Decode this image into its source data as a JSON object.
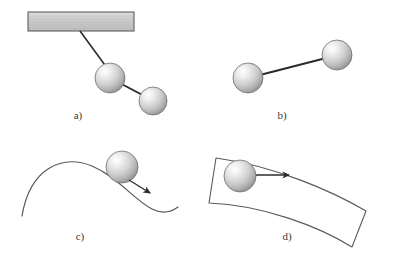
{
  "figure": {
    "background_color": "#ffffff",
    "stroke_color": "#2b2b2b",
    "curve_color": "#5a5a5a",
    "sphere_fill_light": "#fdfdfd",
    "sphere_fill_mid": "#d2d2d2",
    "sphere_fill_dark": "#9a9a9a",
    "sphere_edge": "#6e6e6e",
    "bar_fill": "#c9c9c9",
    "bar_edge": "#5e5e5e"
  },
  "panels": [
    {
      "id": "a",
      "label": "a)",
      "label_x": 78,
      "label_y": 119,
      "description": "double pendulum suspended from a fixed support bar",
      "support_bar": {
        "x": 28,
        "y": 12,
        "width": 106,
        "height": 19
      },
      "rods": [
        {
          "x1": 80,
          "y1": 31,
          "x2": 110,
          "y2": 72
        },
        {
          "x1": 114,
          "y1": 80,
          "x2": 148,
          "y2": 97
        }
      ],
      "spheres": [
        {
          "cx": 110,
          "cy": 78,
          "r": 15
        },
        {
          "cx": 153,
          "cy": 101,
          "r": 14
        }
      ]
    },
    {
      "id": "b",
      "label": "b)",
      "label_x": 282,
      "label_y": 119,
      "description": "free rigid body of two spheres joined by a rod",
      "rods": [
        {
          "x1": 256,
          "y1": 76,
          "x2": 328,
          "y2": 57
        }
      ],
      "spheres": [
        {
          "cx": 248,
          "cy": 78,
          "r": 15
        },
        {
          "cx": 337,
          "cy": 55,
          "r": 15
        }
      ]
    },
    {
      "id": "c",
      "label": "c)",
      "label_x": 80,
      "label_y": 240,
      "description": "ball rolling along an S-shaped curved track with velocity arrow",
      "curve_path": "M 22 216 C 30 168, 62 154, 92 166 C 118 177, 134 200, 152 209 C 162 214, 170 213, 178 207",
      "spheres": [
        {
          "cx": 122,
          "cy": 167,
          "r": 16
        }
      ],
      "arrow": {
        "x1": 129,
        "y1": 179,
        "x2": 150,
        "y2": 192
      }
    },
    {
      "id": "d",
      "label": "d)",
      "label_x": 287,
      "label_y": 240,
      "description": "ball on a curved band surface with horizontal velocity arrow",
      "band_path": "M 216 158 L 209 203 C 262 205, 318 226, 352 247 L 366 211 C 330 190, 274 166, 216 158 Z",
      "band_top_path": "M 216 158 C 274 166, 330 190, 366 211",
      "band_bottom_path": "M 209 203 C 262 205, 318 226, 352 247",
      "spheres": [
        {
          "cx": 240,
          "cy": 176,
          "r": 16
        }
      ],
      "arrow": {
        "x1": 255,
        "y1": 175,
        "x2": 288,
        "y2": 175
      }
    }
  ]
}
